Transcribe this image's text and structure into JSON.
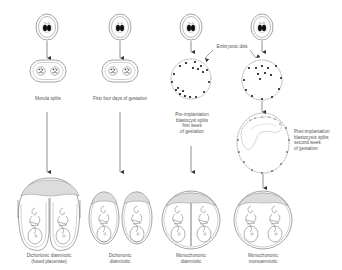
{
  "columns": [
    {
      "id": "dichorionic-diamniotic-fused",
      "split_label": "Morula splits",
      "outcome_line1": "Dichorionic diamniotic",
      "outcome_line2": "(fused placentae)"
    },
    {
      "id": "dichorionic-diamniotic",
      "split_label": "First four days of gestation",
      "outcome_line1": "Dichorionic",
      "outcome_line2": "diamniotic"
    },
    {
      "id": "monochorionic-diamniotic",
      "split_line1": "Pre-implantation",
      "split_line2": "blastocyst splits",
      "split_line3": "first week",
      "split_line4": "of gestation",
      "outcome_line1": "Monochorionic",
      "outcome_line2": "diamniotic"
    },
    {
      "id": "monochorionic-monoamniotic",
      "split_line1": "Post-implantation",
      "split_line2": "blastocysts splits",
      "split_line3": "second week",
      "split_line4": "of gestation",
      "outcome_line1": "Monochorionic",
      "outcome_line2": "monoamniotic"
    }
  ],
  "annotation": {
    "embryonic_disk": "Embryonic disk"
  },
  "colors": {
    "line": "#555555",
    "placenta_fill": "#dcdcdc",
    "dot": "#222222",
    "text": "#555555"
  }
}
